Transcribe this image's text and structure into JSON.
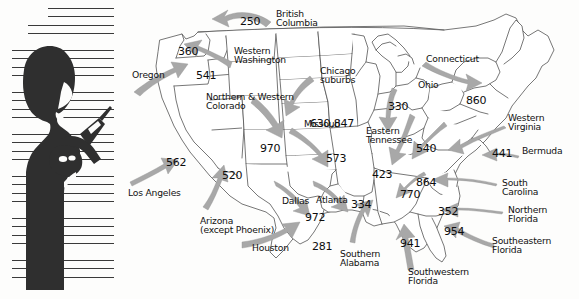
{
  "figure": {
    "caption_alt": "Silhouette of a person holding a mobile phone",
    "icons": {
      "silhouette": "person-with-phone-silhouette",
      "hatching": "horizontal-line-hatching"
    }
  },
  "map": {
    "title": "United States area code migration map",
    "outline_color": "#4a4a4a",
    "arrow_color": "#a8a8a8",
    "arrow_stroke": "#8e8e8e",
    "background": "#fdfdfc"
  },
  "area_codes": [
    {
      "code": "250",
      "x": 116,
      "y": 16,
      "name": "areacode-250"
    },
    {
      "code": "360",
      "x": 54,
      "y": 46,
      "name": "areacode-360"
    },
    {
      "code": "541",
      "x": 72,
      "y": 70,
      "name": "areacode-541"
    },
    {
      "code": "562",
      "x": 42,
      "y": 157,
      "name": "areacode-562"
    },
    {
      "code": "520",
      "x": 98,
      "y": 170,
      "name": "areacode-520"
    },
    {
      "code": "970",
      "x": 136,
      "y": 143,
      "name": "areacode-970"
    },
    {
      "code": "630,847",
      "x": 186,
      "y": 118,
      "name": "areacode-630-847"
    },
    {
      "code": "573",
      "x": 202,
      "y": 153,
      "name": "areacode-573"
    },
    {
      "code": "330",
      "x": 264,
      "y": 101,
      "name": "areacode-330"
    },
    {
      "code": "860",
      "x": 342,
      "y": 95,
      "name": "areacode-860"
    },
    {
      "code": "540",
      "x": 292,
      "y": 143,
      "name": "areacode-540"
    },
    {
      "code": "441",
      "x": 368,
      "y": 148,
      "name": "areacode-441"
    },
    {
      "code": "423",
      "x": 248,
      "y": 169,
      "name": "areacode-423"
    },
    {
      "code": "864",
      "x": 292,
      "y": 177,
      "name": "areacode-864"
    },
    {
      "code": "770",
      "x": 276,
      "y": 189,
      "name": "areacode-770"
    },
    {
      "code": "972",
      "x": 181,
      "y": 212,
      "name": "areacode-972"
    },
    {
      "code": "334",
      "x": 227,
      "y": 199,
      "name": "areacode-334"
    },
    {
      "code": "352",
      "x": 314,
      "y": 206,
      "name": "areacode-352"
    },
    {
      "code": "954",
      "x": 320,
      "y": 226,
      "name": "areacode-954"
    },
    {
      "code": "281",
      "x": 188,
      "y": 241,
      "name": "areacode-281"
    },
    {
      "code": "941",
      "x": 276,
      "y": 238,
      "name": "areacode-941"
    }
  ],
  "region_labels": [
    {
      "text": "British\nColumbia",
      "x": 152,
      "y": 9,
      "align": "left",
      "name": "region-british-columbia"
    },
    {
      "text": "Western\nWashington",
      "x": 110,
      "y": 46,
      "align": "left",
      "name": "region-western-washington"
    },
    {
      "text": "Oregon",
      "x": 8,
      "y": 70,
      "align": "left",
      "name": "region-oregon"
    },
    {
      "text": "Northern & Western\nColorado",
      "x": 82,
      "y": 92,
      "align": "left",
      "name": "region-northern-western-colorado"
    },
    {
      "text": "Chicago\nsuburbs",
      "x": 196,
      "y": 66,
      "align": "left",
      "name": "region-chicago-suburbs"
    },
    {
      "text": "Missouri",
      "x": 180,
      "y": 119,
      "align": "left",
      "name": "region-missouri"
    },
    {
      "text": "Connecticut",
      "x": 302,
      "y": 54,
      "align": "left",
      "name": "region-connecticut"
    },
    {
      "text": "Ohio",
      "x": 294,
      "y": 80,
      "align": "left",
      "name": "region-ohio"
    },
    {
      "text": "Western\nVirginia",
      "x": 384,
      "y": 113,
      "align": "left",
      "name": "region-western-virginia"
    },
    {
      "text": "Bermuda",
      "x": 398,
      "y": 146,
      "align": "left",
      "name": "region-bermuda"
    },
    {
      "text": "Eastern\nTennessee",
      "x": 242,
      "y": 126,
      "align": "left",
      "name": "region-eastern-tennessee"
    },
    {
      "text": "Los Angeles",
      "x": 4,
      "y": 188,
      "align": "left",
      "name": "region-los-angeles"
    },
    {
      "text": "Arizona\n(except Phoenix)",
      "x": 76,
      "y": 216,
      "align": "left",
      "name": "region-arizona"
    },
    {
      "text": "Dallas",
      "x": 158,
      "y": 196,
      "align": "left",
      "name": "region-dallas"
    },
    {
      "text": "Houston",
      "x": 128,
      "y": 243,
      "align": "left",
      "name": "region-houston"
    },
    {
      "text": "Atlanta",
      "x": 192,
      "y": 195,
      "align": "left",
      "name": "region-atlanta"
    },
    {
      "text": "Southern\nAlabama",
      "x": 216,
      "y": 249,
      "align": "left",
      "name": "region-southern-alabama"
    },
    {
      "text": "South\nCarolina",
      "x": 378,
      "y": 178,
      "align": "left",
      "name": "region-south-carolina"
    },
    {
      "text": "Northern\nFlorida",
      "x": 384,
      "y": 205,
      "align": "left",
      "name": "region-northern-florida"
    },
    {
      "text": "Southeastern\nFlorida",
      "x": 368,
      "y": 236,
      "align": "left",
      "name": "region-southeastern-florida"
    },
    {
      "text": "Southwestern\nFlorida",
      "x": 284,
      "y": 267,
      "align": "left",
      "name": "region-southwestern-florida"
    }
  ]
}
